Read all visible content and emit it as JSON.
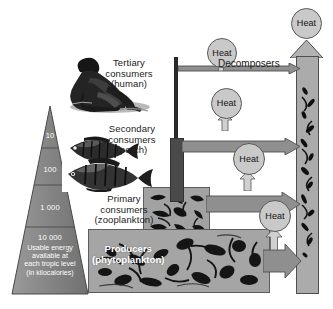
{
  "diagram": {
    "pyramid": {
      "levels": [
        {
          "value": "10"
        },
        {
          "value": "100"
        },
        {
          "value": "1 000"
        },
        {
          "value": "10 000"
        }
      ],
      "caption": "Usable energy\navailable at\neach tropic level\n(in kilocalories)"
    },
    "trophic_labels": [
      {
        "name": "tertiary",
        "text": "Tertiary\nconsumers\n(human)"
      },
      {
        "name": "secondary",
        "text": "Secondary\nconsumers\n(perch)"
      },
      {
        "name": "primary",
        "text": "Primary\nconsumers\n(zooplankton)"
      },
      {
        "name": "producers",
        "text": "Producers\n(phytoplankton)"
      }
    ],
    "decomposers_label": "Decomposers",
    "heat_labels": [
      {
        "id": "heat-top",
        "text": "Heat"
      },
      {
        "id": "heat-tertiary",
        "text": "Heat"
      },
      {
        "id": "heat-secondary",
        "text": "Heat"
      },
      {
        "id": "heat-primary",
        "text": "Heat"
      },
      {
        "id": "heat-producer",
        "text": "Heat"
      }
    ],
    "colors": {
      "pyramid_fill": "#8a8a8a",
      "pyramid_stroke": "#4a4a4a",
      "arrow_fill": "#9a9a9a",
      "arrow_stroke": "#4f4f4f",
      "heat_fill": "#c9c9c9",
      "heat_stroke": "#585858",
      "column_fill": "#a9a9a9",
      "background": "#ffffff",
      "text": "#1b1b1b",
      "label_on_photo": "#ffffff"
    }
  }
}
